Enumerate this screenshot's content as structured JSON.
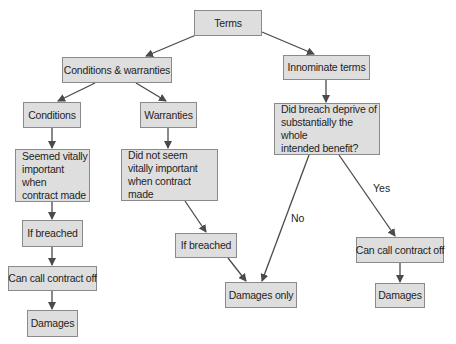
{
  "diagram": {
    "nodes": [
      {
        "id": "terms",
        "label": "Terms"
      },
      {
        "id": "conditions_warranties",
        "label": "Conditions & warranties"
      },
      {
        "id": "innominate_terms",
        "label": "Innominate terms"
      },
      {
        "id": "conditions",
        "label": "Conditions"
      },
      {
        "id": "warranties",
        "label": "Warranties"
      },
      {
        "id": "did_breach_deprive",
        "label": "Did breach deprive of\nsubstantially the whole\nintended benefit?"
      },
      {
        "id": "seemed_vitally_important",
        "label": "Seemed vitally\nimportant when\ncontract made"
      },
      {
        "id": "did_not_seem_vitally_important",
        "label": "Did not seem\nvitally important\nwhen contract made"
      },
      {
        "id": "if_breached_conditions",
        "label": "If breached"
      },
      {
        "id": "can_call_contract_off_conditions",
        "label": "Can call contract off"
      },
      {
        "id": "damages_conditions",
        "label": "Damages"
      },
      {
        "id": "if_breached_warranties",
        "label": "If breached"
      },
      {
        "id": "damages_only",
        "label": "Damages only"
      },
      {
        "id": "can_call_contract_off_innominate",
        "label": "Can call contract off"
      },
      {
        "id": "damages_innominate",
        "label": "Damages"
      }
    ],
    "edges": [
      {
        "from": "terms",
        "to": "conditions_warranties",
        "label": ""
      },
      {
        "from": "terms",
        "to": "innominate_terms",
        "label": ""
      },
      {
        "from": "conditions_warranties",
        "to": "conditions",
        "label": ""
      },
      {
        "from": "conditions_warranties",
        "to": "warranties",
        "label": ""
      },
      {
        "from": "conditions",
        "to": "seemed_vitally_important",
        "label": ""
      },
      {
        "from": "seemed_vitally_important",
        "to": "if_breached_conditions",
        "label": ""
      },
      {
        "from": "if_breached_conditions",
        "to": "can_call_contract_off_conditions",
        "label": ""
      },
      {
        "from": "can_call_contract_off_conditions",
        "to": "damages_conditions",
        "label": ""
      },
      {
        "from": "warranties",
        "to": "did_not_seem_vitally_important",
        "label": ""
      },
      {
        "from": "did_not_seem_vitally_important",
        "to": "if_breached_warranties",
        "label": ""
      },
      {
        "from": "if_breached_warranties",
        "to": "damages_only",
        "label": ""
      },
      {
        "from": "innominate_terms",
        "to": "did_breach_deprive",
        "label": ""
      },
      {
        "from": "did_breach_deprive",
        "to": "damages_only",
        "label": "No"
      },
      {
        "from": "did_breach_deprive",
        "to": "can_call_contract_off_innominate",
        "label": "Yes"
      },
      {
        "from": "can_call_contract_off_innominate",
        "to": "damages_innominate",
        "label": ""
      }
    ],
    "edge_labels": {
      "no": "No",
      "yes": "Yes"
    }
  },
  "colors": {
    "node_fill": "#dedede",
    "node_border": "#8a8a8a",
    "edge": "#4a4a4a",
    "text": "#1e1e1e",
    "background": "#ffffff"
  }
}
